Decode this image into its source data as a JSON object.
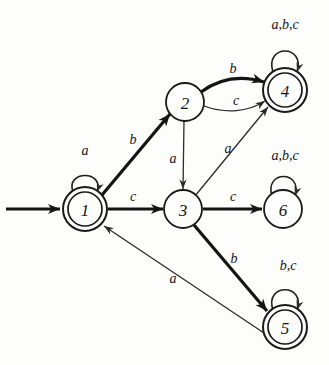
{
  "diagram": {
    "kind": "finite-state-automaton",
    "title": "",
    "background_color": "#fdfdfc",
    "ink_color": "#161616",
    "alphabet": [
      "a",
      "b",
      "c"
    ],
    "start_state": "1",
    "accepting_states": [
      "1",
      "4",
      "5"
    ],
    "start_arrow": {
      "label": "",
      "from_x": 6,
      "from_y": 209,
      "to_x": 60,
      "to_y": 209
    },
    "states": [
      {
        "id": "1",
        "label": "1",
        "cx": 85,
        "cy": 209,
        "r": 22,
        "accepting": true,
        "inner_r": 17
      },
      {
        "id": "2",
        "label": "2",
        "cx": 185,
        "cy": 102,
        "r": 19,
        "accepting": false,
        "inner_r": 0
      },
      {
        "id": "3",
        "label": "3",
        "cx": 183,
        "cy": 209,
        "r": 19,
        "accepting": false,
        "inner_r": 0
      },
      {
        "id": "4",
        "label": "4",
        "cx": 285,
        "cy": 90,
        "r": 22,
        "accepting": true,
        "inner_r": 17
      },
      {
        "id": "5",
        "label": "5",
        "cx": 285,
        "cy": 327,
        "r": 22,
        "accepting": true,
        "inner_r": 17
      },
      {
        "id": "6",
        "label": "6",
        "cx": 283,
        "cy": 209,
        "r": 19,
        "accepting": false,
        "inner_r": 0
      }
    ],
    "self_loops": [
      {
        "id": "loop-1",
        "state": "1",
        "label": "a",
        "label_x": 85,
        "label_y": 150,
        "path": "M 73 192 C 65 170 105 170 97 192",
        "tip_x": 97,
        "tip_y": 192,
        "tip_angle": 110
      },
      {
        "id": "loop-4",
        "state": "4",
        "label": "a,b,c",
        "label_x": 285,
        "label_y": 24,
        "path": "M 273 72 C 264 44 306 44 297 72",
        "tip_x": 297,
        "tip_y": 72,
        "tip_angle": 108
      },
      {
        "id": "loop-5",
        "state": "5",
        "label": "b,c",
        "label_x": 288,
        "label_y": 265,
        "path": "M 273 310 C 264 283 306 283 297 310",
        "tip_x": 297,
        "tip_y": 310,
        "tip_angle": 108
      },
      {
        "id": "loop-6",
        "state": "6",
        "label": "a,b,c",
        "label_x": 285,
        "label_y": 155,
        "path": "M 272 196 C 264 170 303 170 295 196",
        "tip_x": 295,
        "tip_y": 196,
        "tip_angle": 108
      }
    ],
    "transitions": [
      {
        "id": "t-1-2",
        "from": "1",
        "to": "2",
        "label": "b",
        "label_x": 133,
        "label_y": 139,
        "weight": "thick",
        "path": "M 102 195 L 170 114",
        "tip_x": 170,
        "tip_y": 114,
        "tip_angle": 310
      },
      {
        "id": "t-1-3",
        "from": "1",
        "to": "3",
        "label": "c",
        "label_x": 133,
        "label_y": 196,
        "weight": "thick",
        "path": "M 108 209 L 163 209",
        "tip_x": 163,
        "tip_y": 209,
        "tip_angle": 0
      },
      {
        "id": "t-2-3",
        "from": "2",
        "to": "3",
        "label": "a",
        "label_x": 173,
        "label_y": 158,
        "weight": "thin",
        "path": "M 184 121 L 183 189",
        "tip_x": 183,
        "tip_y": 189,
        "tip_angle": 90
      },
      {
        "id": "t-2-4-b",
        "from": "2",
        "to": "4",
        "label": "b",
        "label_x": 233,
        "label_y": 68,
        "weight": "thick",
        "path": "M 201 92 C 223 76 244 76 264 82",
        "tip_x": 264,
        "tip_y": 82,
        "tip_angle": 17
      },
      {
        "id": "t-2-4-c",
        "from": "2",
        "to": "4",
        "label": "c",
        "label_x": 236,
        "label_y": 100,
        "weight": "thin",
        "path": "M 204 106 C 226 114 248 112 265 101",
        "tip_x": 265,
        "tip_y": 101,
        "tip_angle": -33
      },
      {
        "id": "t-3-4",
        "from": "3",
        "to": "4",
        "label": "a",
        "label_x": 228,
        "label_y": 148,
        "weight": "thin",
        "path": "M 195 196 L 268 107",
        "tip_x": 268,
        "tip_y": 107,
        "tip_angle": 309
      },
      {
        "id": "t-3-6",
        "from": "3",
        "to": "6",
        "label": "c",
        "label_x": 233,
        "label_y": 196,
        "weight": "thick",
        "path": "M 203 209 L 262 209",
        "tip_x": 262,
        "tip_y": 209,
        "tip_angle": 0
      },
      {
        "id": "t-3-5",
        "from": "3",
        "to": "5",
        "label": "b",
        "label_x": 234,
        "label_y": 258,
        "weight": "thick",
        "path": "M 194 225 L 267 311",
        "tip_x": 267,
        "tip_y": 311,
        "tip_angle": 50
      },
      {
        "id": "t-5-1",
        "from": "5",
        "to": "1",
        "label": "a",
        "label_x": 173,
        "label_y": 278,
        "weight": "thin",
        "path": "M 264 333 L 104 226",
        "tip_x": 104,
        "tip_y": 226,
        "tip_angle": 213
      }
    ]
  }
}
